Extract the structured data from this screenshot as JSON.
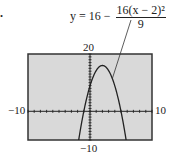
{
  "problem": {
    "number": "."
  },
  "equation": {
    "lhs": "y = 16 −",
    "numerator": "16(x − 2)²",
    "denominator": "9"
  },
  "window_labels": {
    "ymax": "20",
    "ymin": "−10",
    "xmin": "−10",
    "xmax": "10"
  },
  "chart_data": {
    "type": "line",
    "xlabel": "",
    "ylabel": "",
    "xlim": [
      -10,
      10
    ],
    "ylim": [
      -10,
      20
    ],
    "grid": false,
    "tick_marks": {
      "x_step": 1,
      "y_step": 1
    },
    "series": [
      {
        "name": "y = 16 − 16(x − 2)²/9",
        "x": [
          -1.7,
          -1,
          0,
          1,
          2,
          3,
          4,
          5,
          5.7
        ],
        "y": [
          -8.3,
          0,
          8.89,
          14.22,
          16,
          14.22,
          8.89,
          0,
          -8.3
        ]
      }
    ],
    "annotations": [
      {
        "text": "y = 16 − 16(x − 2)²/9",
        "arrow_to": [
          3.6,
          11.4
        ]
      }
    ],
    "vertex": [
      2,
      16
    ],
    "x_intercepts": [
      -1,
      5
    ],
    "y_intercept": 8.89,
    "colors": {
      "screen": "#d9d9d9",
      "frame": "#333333",
      "curve": "#222222"
    }
  }
}
